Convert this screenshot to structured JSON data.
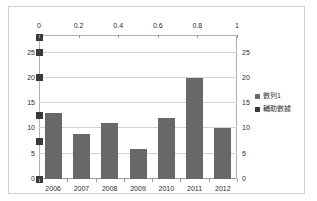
{
  "chart_data": {
    "type": "bar",
    "title": "",
    "subtitle": "",
    "xlabel": "",
    "ylabel": "",
    "categories": [
      "2006",
      "2007",
      "2008",
      "2009",
      "2010",
      "2011",
      "2012"
    ],
    "series": [
      {
        "name": "數列1",
        "type": "bar",
        "color": "#686868",
        "axis": "primary",
        "values": [
          13,
          9,
          11,
          6,
          12,
          20,
          10
        ]
      },
      {
        "name": "輔助數據",
        "type": "scatter",
        "color": "#3a3a3a",
        "axis": "primary",
        "x": [
          0,
          0,
          0,
          0,
          0,
          0
        ],
        "values": [
          0,
          7.5,
          12.5,
          20,
          25,
          28
        ]
      }
    ],
    "ylim": [
      0,
      28.5
    ],
    "yticks": [
      0,
      5,
      10,
      15,
      20,
      25
    ],
    "y2lim": [
      0,
      28.5
    ],
    "y2ticks": [
      0,
      5,
      10,
      15,
      20,
      25
    ],
    "x2lim": [
      0,
      1
    ],
    "x2ticks": [
      0,
      0.2,
      0.4,
      0.6,
      0.8,
      1
    ],
    "grid": true,
    "legend_position": "right"
  },
  "axes": {
    "top_ticks": [
      "0",
      "0.2",
      "0.4",
      "0.6",
      "0.8",
      "1"
    ],
    "left_ticks": [
      "25",
      "20",
      "15",
      "10",
      "5",
      "0"
    ],
    "right_ticks": [
      "25",
      "20",
      "15",
      "10",
      "5",
      "0"
    ],
    "bottom_ticks": [
      "2006",
      "2007",
      "2008",
      "2009",
      "2010",
      "2011",
      "2012"
    ]
  },
  "legend": {
    "items": [
      {
        "label": "數列1",
        "color": "#686868"
      },
      {
        "label": "輔助數據",
        "color": "#3a3a3a"
      }
    ]
  }
}
